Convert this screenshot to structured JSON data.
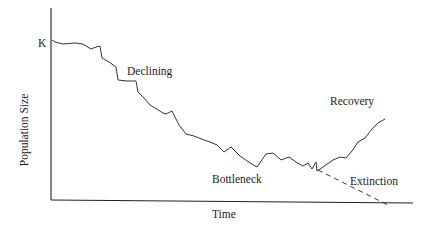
{
  "chart_data": {
    "type": "line",
    "title": "",
    "xlabel": "Time",
    "ylabel": "Population Size",
    "y_tick_labels": [
      "K"
    ],
    "annotations": [
      "Declining",
      "Bottleneck",
      "Recovery",
      "Extinction"
    ],
    "grid": false,
    "legend": "none",
    "series": [
      {
        "name": "Population (observed, recovery path)",
        "style": "solid",
        "points_px": [
          [
            52,
            40
          ],
          [
            55,
            42
          ],
          [
            63,
            44
          ],
          [
            75,
            43
          ],
          [
            83,
            44
          ],
          [
            91,
            49
          ],
          [
            96,
            47
          ],
          [
            100,
            46
          ],
          [
            102,
            58
          ],
          [
            109,
            62
          ],
          [
            116,
            67
          ],
          [
            118,
            80
          ],
          [
            127,
            81
          ],
          [
            136,
            81
          ],
          [
            138,
            92
          ],
          [
            145,
            99
          ],
          [
            150,
            105
          ],
          [
            155,
            108
          ],
          [
            163,
            113
          ],
          [
            166,
            114
          ],
          [
            172,
            111
          ],
          [
            179,
            125
          ],
          [
            186,
            134
          ],
          [
            194,
            136
          ],
          [
            204,
            140
          ],
          [
            210,
            142
          ],
          [
            217,
            145
          ],
          [
            224,
            152
          ],
          [
            231,
            147
          ],
          [
            240,
            156
          ],
          [
            250,
            163
          ],
          [
            257,
            167
          ],
          [
            266,
            154
          ],
          [
            273,
            153
          ],
          [
            281,
            160
          ],
          [
            289,
            157
          ],
          [
            296,
            162
          ],
          [
            303,
            166
          ],
          [
            308,
            163
          ],
          [
            312,
            169
          ],
          [
            316,
            162
          ],
          [
            317,
            171
          ],
          [
            323,
            167
          ],
          [
            333,
            160
          ],
          [
            340,
            157
          ],
          [
            346,
            158
          ],
          [
            352,
            151
          ],
          [
            358,
            142
          ],
          [
            365,
            138
          ],
          [
            372,
            129
          ],
          [
            378,
            123
          ],
          [
            385,
            119
          ]
        ]
      },
      {
        "name": "Extinction path",
        "style": "dashed",
        "points_px": [
          [
            318,
            170
          ],
          [
            388,
            205
          ]
        ]
      }
    ]
  },
  "labels": {
    "k": "K",
    "declining": "Declining",
    "bottleneck": "Bottleneck",
    "recovery": "Recovery",
    "extinction": "Extinction",
    "x_axis": "Time",
    "y_axis": "Population Size"
  }
}
